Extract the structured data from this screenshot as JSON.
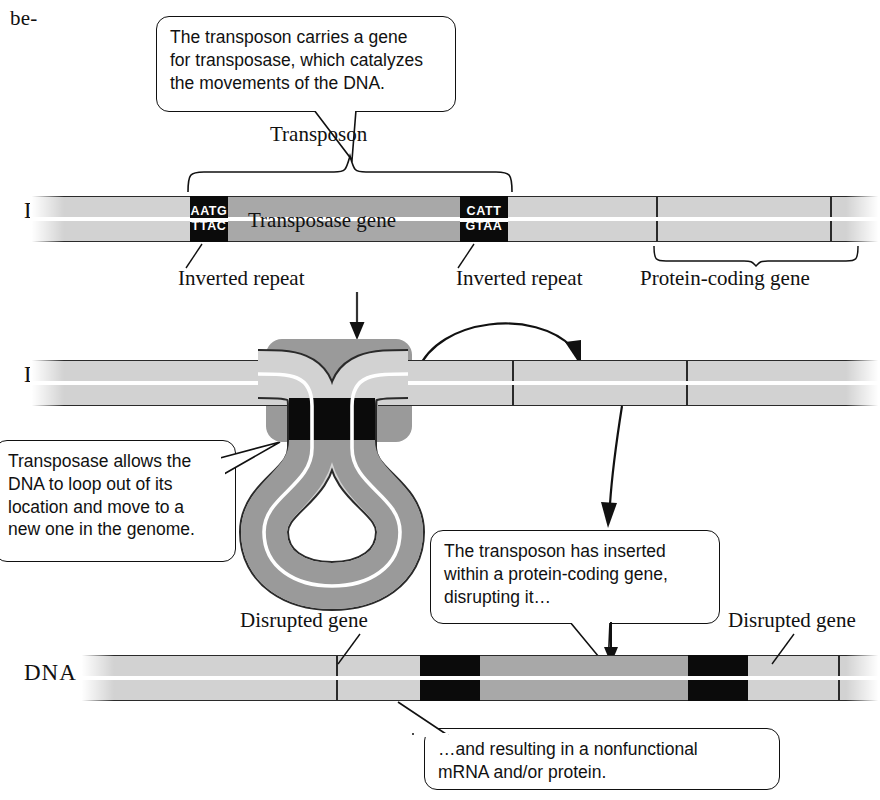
{
  "page": {
    "text_fragment": "be-",
    "dna_label": "DNA"
  },
  "callouts": {
    "transposase_gene": "The transposon carries a gene\nfor transposase, which catalyzes\nthe movements of the DNA.",
    "loop_out": "Transposase allows the\nDNA to loop out of its\nlocation and move to a\nnew one in the genome.",
    "inserted": "The transposon has inserted\nwithin a protein-coding gene,\ndisrupting it…",
    "nonfunctional": "…and resulting in a nonfunctional\nmRNA and/or protein."
  },
  "panel1": {
    "dna_label": "DNA",
    "bracket_label": "Transposon",
    "transposase_gene_label": "Transposase gene",
    "inverted_repeat_left_label": "Inverted repeat",
    "inverted_repeat_right_label": "Inverted repeat",
    "protein_coding_gene_label": "Protein-coding gene",
    "inverted_repeat_left": {
      "top": "AATG",
      "bottom": "TTAC"
    },
    "inverted_repeat_right": {
      "top": "CATT",
      "bottom": "GTAA"
    }
  },
  "panel2": {
    "dna_label": "DNA"
  },
  "panel3": {
    "dna_label": "DNA",
    "disrupted_gene_left_label": "Disrupted gene",
    "disrupted_gene_right_label": "Disrupted gene"
  },
  "colors": {
    "dna_light": "#d2d2d2",
    "dna_medium": "#a8a8a8",
    "inverted_repeat": "#0b0b0b",
    "transposase_protein": "#9a9a9a",
    "outline": "#2a2a2a",
    "background": "#ffffff"
  }
}
